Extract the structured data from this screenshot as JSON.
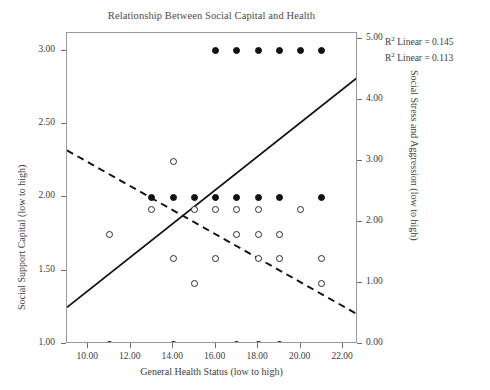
{
  "chart_data": {
    "type": "scatter",
    "title": "Relationship Between Social Capital and Health",
    "xlabel": "General Health Status (low to high)",
    "ylabel": "Social Support Capital (low to high)",
    "ylabel_right": "Social Stress and Aggression (low to high)",
    "xlim": [
      9.0,
      22.7
    ],
    "ylim_left": [
      1.0,
      3.12
    ],
    "ylim_right": [
      0.0,
      5.1
    ],
    "grid": false,
    "legend": "none",
    "xticks": [
      "10.00",
      "12.00",
      "14.00",
      "16.00",
      "18.00",
      "20.00",
      "22.00"
    ],
    "xtick_values": [
      10,
      12,
      14,
      16,
      18,
      20,
      22
    ],
    "yticks_left": [
      "1.00",
      "1.50",
      "2.00",
      "2.50",
      "3.00"
    ],
    "ytick_values_left": [
      1.0,
      1.5,
      2.0,
      2.5,
      3.0
    ],
    "yticks_right": [
      "0.00",
      "1.00",
      "2.00",
      "3.00",
      "4.00",
      "5.00"
    ],
    "ytick_values_right": [
      0,
      1,
      2,
      3,
      4,
      5
    ],
    "series": [
      {
        "name": "Social Support Capital",
        "marker": "filled-circle",
        "axis": "left",
        "color": "#111111",
        "points": [
          {
            "x": 16,
            "y": 3.0
          },
          {
            "x": 17,
            "y": 3.0
          },
          {
            "x": 18,
            "y": 3.0
          },
          {
            "x": 19,
            "y": 3.0
          },
          {
            "x": 20,
            "y": 3.0
          },
          {
            "x": 21,
            "y": 3.0
          },
          {
            "x": 13,
            "y": 2.0
          },
          {
            "x": 14,
            "y": 2.0
          },
          {
            "x": 15,
            "y": 2.0
          },
          {
            "x": 16,
            "y": 2.0
          },
          {
            "x": 17,
            "y": 2.0
          },
          {
            "x": 18,
            "y": 2.0
          },
          {
            "x": 19,
            "y": 2.0
          },
          {
            "x": 21,
            "y": 2.0
          },
          {
            "x": 11,
            "y": 1.0
          },
          {
            "x": 14,
            "y": 1.0
          },
          {
            "x": 17,
            "y": 1.0
          },
          {
            "x": 18,
            "y": 1.0
          },
          {
            "x": 19,
            "y": 1.0
          }
        ]
      },
      {
        "name": "Social Stress and Aggression",
        "marker": "open-circle",
        "axis": "right",
        "color": "#2b2b2b",
        "points": [
          {
            "x": 14,
            "y": 3.0
          },
          {
            "x": 13,
            "y": 2.2
          },
          {
            "x": 15,
            "y": 2.2
          },
          {
            "x": 16,
            "y": 2.2
          },
          {
            "x": 17,
            "y": 2.2
          },
          {
            "x": 18,
            "y": 2.2
          },
          {
            "x": 20,
            "y": 2.2
          },
          {
            "x": 11,
            "y": 1.8
          },
          {
            "x": 17,
            "y": 1.8
          },
          {
            "x": 18,
            "y": 1.8
          },
          {
            "x": 19,
            "y": 1.8
          },
          {
            "x": 14,
            "y": 1.4
          },
          {
            "x": 16,
            "y": 1.4
          },
          {
            "x": 18,
            "y": 1.4
          },
          {
            "x": 19,
            "y": 1.4
          },
          {
            "x": 21,
            "y": 1.4
          },
          {
            "x": 15,
            "y": 1.0
          },
          {
            "x": 21,
            "y": 1.0
          }
        ]
      }
    ],
    "trend_lines": [
      {
        "name": "support-fit",
        "style": "solid",
        "color": "#111111",
        "x_start": 9.0,
        "y_start": 1.25,
        "x_end": 22.7,
        "y_end": 2.82,
        "r_squared": "0.145"
      },
      {
        "name": "stress-fit",
        "style": "dashed",
        "color": "#111111",
        "x_start": 9.0,
        "y_start": 2.32,
        "x_end": 22.7,
        "y_end": 1.2,
        "r_squared": "0.113"
      }
    ],
    "annotations": [
      {
        "name": "r-squared-linear-1",
        "text": "R² Linear = 0.145",
        "label": "R",
        "exponent": "2",
        "rest": " Linear = 0.145"
      },
      {
        "name": "r-squared-linear-2",
        "text": "R² Linear = 0.113",
        "label": "R",
        "exponent": "2",
        "rest": " Linear = 0.113"
      }
    ]
  }
}
